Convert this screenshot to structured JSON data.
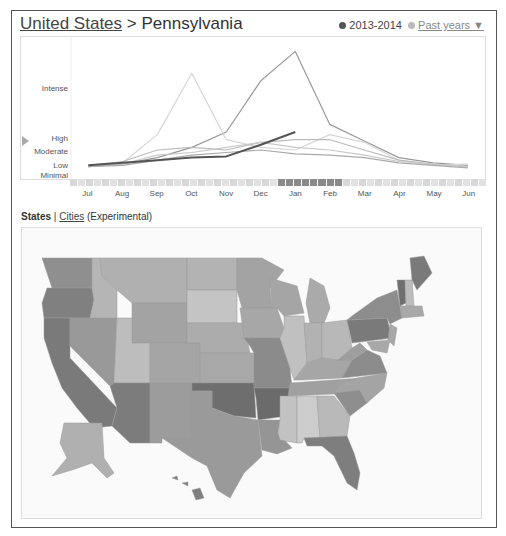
{
  "header": {
    "breadcrumb_root": "United States",
    "breadcrumb_sep": ">",
    "breadcrumb_current": "Pennsylvania",
    "legend_current": "2013-2014",
    "legend_past": "Past years ▼",
    "current_color": "#555555",
    "past_color": "#bbbbbb"
  },
  "tabs": {
    "states": "States",
    "sep": "|",
    "cities": "Cities",
    "experimental": "(Experimental)"
  },
  "chart_data": {
    "type": "line",
    "title": "United States > Pennsylvania",
    "xlabel": "",
    "ylabel": "Flu activity level",
    "y_tick_labels": [
      "Minimal",
      "Low",
      "Moderate",
      "High",
      "Intense"
    ],
    "categories": [
      "Jul",
      "Aug",
      "Sep",
      "Oct",
      "Nov",
      "Dec",
      "Jan",
      "Feb",
      "Mar",
      "Apr",
      "May",
      "Jun"
    ],
    "ylim": [
      0,
      100
    ],
    "legend": [
      "2013-2014",
      "Past years"
    ],
    "series": [
      {
        "name": "2013-2014",
        "color": "#555555",
        "values": [
          6,
          8,
          10,
          12,
          13,
          22,
          32,
          null,
          null,
          null,
          null,
          null
        ]
      },
      {
        "name": "Past year A (peak Jan)",
        "color": "#999999",
        "values": [
          5,
          7,
          12,
          20,
          32,
          72,
          95,
          38,
          25,
          12,
          8,
          6
        ]
      },
      {
        "name": "Past year B (peak Oct)",
        "color": "#d6d6d6",
        "values": [
          5,
          8,
          30,
          78,
          26,
          20,
          18,
          30,
          24,
          10,
          6,
          7
        ]
      },
      {
        "name": "Past year C",
        "color": "#bbbbbb",
        "values": [
          6,
          9,
          18,
          20,
          18,
          24,
          26,
          26,
          18,
          10,
          7,
          5
        ]
      },
      {
        "name": "Past year D",
        "color": "#c8c8c8",
        "values": [
          5,
          7,
          14,
          16,
          20,
          24,
          20,
          18,
          14,
          9,
          7,
          5
        ]
      },
      {
        "name": "Past year E",
        "color": "#aaaaaa",
        "values": [
          5,
          6,
          10,
          14,
          16,
          18,
          15,
          14,
          12,
          8,
          6,
          4
        ]
      }
    ],
    "grid": false,
    "legend_position": "top-right",
    "current_marker_level": "High"
  },
  "strip": {
    "weeks": 52,
    "highlight_start": 26,
    "highlight_end": 33
  },
  "map": {
    "label": "States",
    "legend_note": "Darker shading = higher flu activity",
    "states": [
      {
        "name": "Washington",
        "shade": "#8f8f8f"
      },
      {
        "name": "Oregon",
        "shade": "#808080"
      },
      {
        "name": "California",
        "shade": "#7a7a7a"
      },
      {
        "name": "Nevada",
        "shade": "#999999"
      },
      {
        "name": "Idaho",
        "shade": "#b5b5b5"
      },
      {
        "name": "Montana",
        "shade": "#b0b0b0"
      },
      {
        "name": "Wyoming",
        "shade": "#a3a3a3"
      },
      {
        "name": "Utah",
        "shade": "#bdbdbd"
      },
      {
        "name": "Arizona",
        "shade": "#7c7c7c"
      },
      {
        "name": "Colorado",
        "shade": "#a5a5a5"
      },
      {
        "name": "New Mexico",
        "shade": "#9c9c9c"
      },
      {
        "name": "North Dakota",
        "shade": "#b3b3b3"
      },
      {
        "name": "South Dakota",
        "shade": "#c4c4c4"
      },
      {
        "name": "Nebraska",
        "shade": "#acacac"
      },
      {
        "name": "Kansas",
        "shade": "#a8a8a8"
      },
      {
        "name": "Oklahoma",
        "shade": "#6e6e6e"
      },
      {
        "name": "Texas",
        "shade": "#9a9a9a"
      },
      {
        "name": "Minnesota",
        "shade": "#a3a3a3"
      },
      {
        "name": "Iowa",
        "shade": "#a7a7a7"
      },
      {
        "name": "Missouri",
        "shade": "#8b8b8b"
      },
      {
        "name": "Arkansas",
        "shade": "#6b6b6b"
      },
      {
        "name": "Louisiana",
        "shade": "#959595"
      },
      {
        "name": "Wisconsin",
        "shade": "#a5a5a5"
      },
      {
        "name": "Illinois",
        "shade": "#c0c0c0"
      },
      {
        "name": "Michigan",
        "shade": "#aaaaaa"
      },
      {
        "name": "Indiana",
        "shade": "#b2b2b2"
      },
      {
        "name": "Ohio",
        "shade": "#b8b8b8"
      },
      {
        "name": "Kentucky",
        "shade": "#a6a6a6"
      },
      {
        "name": "Tennessee",
        "shade": "#a0a0a0"
      },
      {
        "name": "Mississippi",
        "shade": "#c2c2c2"
      },
      {
        "name": "Alabama",
        "shade": "#cccccc"
      },
      {
        "name": "Georgia",
        "shade": "#b9b9b9"
      },
      {
        "name": "Florida",
        "shade": "#7e7e7e"
      },
      {
        "name": "South Carolina",
        "shade": "#8e8e8e"
      },
      {
        "name": "North Carolina",
        "shade": "#a4a4a4"
      },
      {
        "name": "Virginia",
        "shade": "#8c8c8c"
      },
      {
        "name": "West Virginia",
        "shade": "#9e9e9e"
      },
      {
        "name": "Pennsylvania",
        "shade": "#7a7a7a"
      },
      {
        "name": "New York",
        "shade": "#8d8d8d"
      },
      {
        "name": "Vermont",
        "shade": "#6f6f6f"
      },
      {
        "name": "New Hampshire",
        "shade": "#bcbcbc"
      },
      {
        "name": "Maine",
        "shade": "#7a7a7a"
      },
      {
        "name": "Alaska",
        "shade": "#b0b0b0"
      },
      {
        "name": "Hawaii",
        "shade": "#7f7f7f"
      }
    ]
  }
}
